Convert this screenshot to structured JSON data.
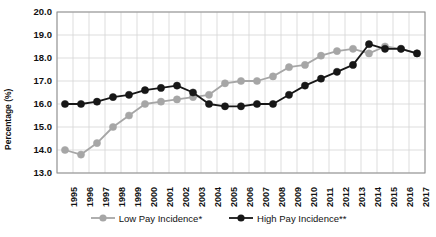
{
  "chart_data": {
    "type": "line",
    "title": "",
    "xlabel": "",
    "ylabel": "Percentage (%)",
    "ylim": [
      13.0,
      20.0
    ],
    "ytick_labels": [
      "20.0",
      "19.0",
      "18.0",
      "17.0",
      "16.0",
      "15.0",
      "14.0",
      "13.0"
    ],
    "ytick_values": [
      20.0,
      19.0,
      18.0,
      17.0,
      16.0,
      15.0,
      14.0,
      13.0
    ],
    "grid": true,
    "legend_position": "bottom",
    "categories": [
      "1995",
      "1996",
      "1997",
      "1998",
      "1999",
      "2000",
      "2001",
      "2002",
      "2003",
      "2004",
      "2005",
      "2006",
      "2007",
      "2008",
      "2009",
      "2010",
      "2011",
      "2012",
      "2013",
      "2014",
      "2015",
      "2016",
      "2017"
    ],
    "series": [
      {
        "name": "Low Pay Incidence*",
        "color": "#a6a6a6",
        "marker": "circle",
        "values": [
          14.0,
          13.8,
          14.3,
          15.0,
          15.5,
          16.0,
          16.1,
          16.2,
          16.3,
          16.4,
          16.9,
          17.0,
          17.0,
          17.2,
          17.6,
          17.7,
          18.1,
          18.3,
          18.4,
          18.2,
          18.5,
          18.4,
          18.2
        ]
      },
      {
        "name": "High Pay Incidence**",
        "color": "#171717",
        "marker": "circle",
        "values": [
          16.0,
          16.0,
          16.1,
          16.3,
          16.4,
          16.6,
          16.7,
          16.8,
          16.5,
          16.0,
          15.9,
          15.9,
          16.0,
          16.0,
          16.4,
          16.8,
          17.1,
          17.4,
          17.7,
          18.6,
          18.4,
          18.4,
          18.2
        ]
      }
    ]
  },
  "legend": {
    "items": [
      {
        "label": "Low Pay Incidence*",
        "color": "#a6a6a6"
      },
      {
        "label": "High Pay Incidence**",
        "color": "#171717"
      }
    ]
  }
}
